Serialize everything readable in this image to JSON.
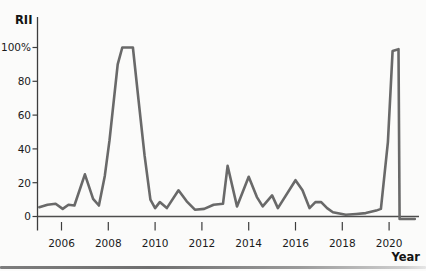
{
  "page": {
    "background": "#fbfbfa"
  },
  "chart_data": {
    "type": "line",
    "ylabel": "RII",
    "xlabel": "Year",
    "grid": false,
    "legend": false,
    "y_axis": {
      "range": [
        0,
        100
      ],
      "ticks": [
        [
          0,
          "0"
        ],
        [
          20,
          "20"
        ],
        [
          40,
          "40"
        ],
        [
          60,
          "60"
        ],
        [
          80,
          "80"
        ],
        [
          100,
          "100%"
        ]
      ]
    },
    "x_axis": {
      "range": [
        2005,
        2021.1
      ],
      "ticks": [
        [
          2006,
          "2006"
        ],
        [
          2008,
          "2008"
        ],
        [
          2010,
          "2010"
        ],
        [
          2012,
          "2012"
        ],
        [
          2014,
          "2014"
        ],
        [
          2016,
          "2016"
        ],
        [
          2018,
          "2018"
        ],
        [
          2020,
          "2020"
        ]
      ]
    },
    "colors": {
      "line": "#696969",
      "axis": "#3d3d3d",
      "zero_line": "#4d4d4d",
      "text": "#1a1a1a"
    },
    "series": [
      {
        "name": "RII",
        "points": [
          [
            2005.05,
            5.5
          ],
          [
            2005.4,
            7
          ],
          [
            2005.75,
            7.5
          ],
          [
            2006.05,
            4.5
          ],
          [
            2006.3,
            7
          ],
          [
            2006.55,
            6.5
          ],
          [
            2007.0,
            25
          ],
          [
            2007.35,
            10.5
          ],
          [
            2007.6,
            6.5
          ],
          [
            2007.85,
            24
          ],
          [
            2008.05,
            45
          ],
          [
            2008.4,
            90
          ],
          [
            2008.6,
            100
          ],
          [
            2009.05,
            100
          ],
          [
            2009.3,
            68
          ],
          [
            2009.55,
            36
          ],
          [
            2009.8,
            10
          ],
          [
            2010.0,
            5
          ],
          [
            2010.2,
            8.5
          ],
          [
            2010.5,
            5
          ],
          [
            2011.0,
            15.5
          ],
          [
            2011.35,
            9
          ],
          [
            2011.7,
            4
          ],
          [
            2012.1,
            4.5
          ],
          [
            2012.5,
            7
          ],
          [
            2012.9,
            7.5
          ],
          [
            2013.1,
            30
          ],
          [
            2013.5,
            6
          ],
          [
            2014.0,
            23.5
          ],
          [
            2014.35,
            11.5
          ],
          [
            2014.6,
            6
          ],
          [
            2015.0,
            12.5
          ],
          [
            2015.25,
            5
          ],
          [
            2016.0,
            21.5
          ],
          [
            2016.3,
            15.5
          ],
          [
            2016.6,
            5
          ],
          [
            2016.85,
            8.5
          ],
          [
            2017.1,
            8.5
          ],
          [
            2017.35,
            5
          ],
          [
            2017.6,
            2.5
          ],
          [
            2018.15,
            1
          ],
          [
            2018.6,
            1.5
          ],
          [
            2019.0,
            2
          ],
          [
            2019.45,
            3.5
          ],
          [
            2019.65,
            4.5
          ],
          [
            2019.95,
            44
          ],
          [
            2020.15,
            98
          ],
          [
            2020.4,
            99
          ],
          [
            2020.45,
            -1.5
          ],
          [
            2021.1,
            -1.5
          ]
        ]
      }
    ]
  }
}
